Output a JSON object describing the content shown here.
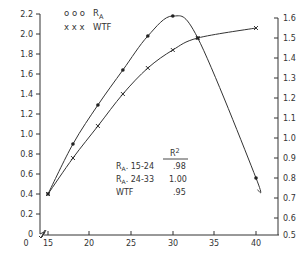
{
  "chart_data": {
    "type": "line",
    "title": "",
    "xlabel": "",
    "ylabel_left": "",
    "ylabel_right": "",
    "x_ticks": [
      15,
      20,
      25,
      30,
      35,
      40
    ],
    "x_origin_label": "0",
    "xlim": [
      15,
      42
    ],
    "left_axis": {
      "ylim": [
        0,
        2.2
      ],
      "ticks": [
        "0",
        "0.2",
        "0.4",
        "0.6",
        "0.8",
        "1.0",
        "1.2",
        "1.4",
        "1.6",
        "1.8",
        "2.0",
        "2.2"
      ]
    },
    "right_axis": {
      "ylim": [
        0.5,
        1.6
      ],
      "ticks": [
        "0.5",
        "0.6",
        "0.7",
        "0.8",
        "0.9",
        "1.0",
        "1.1",
        "1.2",
        "1.3",
        "1.4",
        "1.5",
        "1.6"
      ]
    },
    "grid": false,
    "legend_position": "upper-left",
    "series": [
      {
        "name": "RA",
        "legend_label": "R",
        "legend_subscript": "A",
        "marker": "dot",
        "axis": "left",
        "x": [
          15,
          18,
          21,
          24,
          27,
          30,
          33,
          40
        ],
        "values": [
          0.4,
          0.9,
          1.29,
          1.64,
          1.98,
          2.18,
          1.96,
          0.56
        ]
      },
      {
        "name": "WTF",
        "legend_label": "WTF",
        "marker": "x",
        "axis": "right",
        "x": [
          15,
          18,
          21,
          24,
          27,
          30,
          33,
          40
        ],
        "values": [
          0.72,
          0.9,
          1.06,
          1.22,
          1.35,
          1.44,
          1.5,
          1.55
        ]
      }
    ],
    "annotation_table": {
      "header": "R²",
      "rows": [
        {
          "label": "R",
          "sub": "A",
          "range": ". 15-24",
          "value": ".98"
        },
        {
          "label": "R",
          "sub": "A",
          "range": ". 24-33",
          "value": "1.00"
        },
        {
          "label": "WTF",
          "sub": "",
          "range": "",
          "value": ".95"
        }
      ]
    }
  },
  "legend": {
    "ra_markers": "o o o",
    "ra_label": "R",
    "ra_sub": "A",
    "wtf_markers": "x x x",
    "wtf_label": "WTF"
  },
  "table": {
    "header": "R",
    "header_sup": "2",
    "row1_label": "R",
    "row1_sub": "A",
    "row1_range": ". 15-24",
    "row1_value": ".98",
    "row2_label": "R",
    "row2_sub": "A",
    "row2_range": ". 24-33",
    "row2_value": "1.00",
    "row3_label": "WTF",
    "row3_value": ".95"
  },
  "axes": {
    "x_origin": "0",
    "left_origin": "0",
    "x_ticks": [
      "15",
      "20",
      "25",
      "30",
      "35",
      "40"
    ],
    "left_ticks": [
      "0.2",
      "0.4",
      "0.6",
      "0.8",
      "1.0",
      "1.2",
      "1.4",
      "1.6",
      "1.8",
      "2.0",
      "2.2"
    ],
    "right_ticks": [
      "0.5",
      "0.6",
      "0.7",
      "0.8",
      "0.9",
      "1.0",
      "1.1",
      "1.2",
      "1.3",
      "1.4",
      "1.5",
      "1.6"
    ]
  }
}
